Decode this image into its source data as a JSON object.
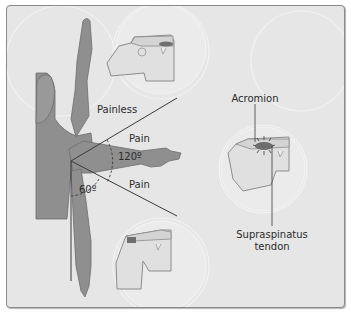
{
  "diagram": {
    "labels": {
      "painless": "Painless",
      "pain_upper": "Pain",
      "pain_lower": "Pain",
      "angle_upper": "120º",
      "angle_lower": "60º",
      "acromion": "Acromion",
      "supraspinatus_line1": "Supraspinatus",
      "supraspinatus_line2": "tendon"
    },
    "colors": {
      "background": "#e6e6e6",
      "body_fill": "#8f8f8f",
      "body_stroke": "#6d6d6d",
      "line": "#3a3a3a",
      "bone_fill": "#e2e2e2",
      "bone_stroke": "#8c8c8c",
      "tendon_highlight": "#6e6e6e",
      "halo": "#f0f0f0"
    },
    "insets": [
      {
        "name": "shoulder-top-inset",
        "state": "arm raised"
      },
      {
        "name": "shoulder-right-inset",
        "state": "impingement (painful arc)"
      },
      {
        "name": "shoulder-bottom-inset",
        "state": "arm at side"
      }
    ]
  }
}
